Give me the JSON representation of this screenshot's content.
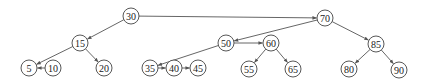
{
  "diagram": {
    "type": "skip-list-tree",
    "nodes": [
      {
        "id": "n30",
        "label": "30",
        "x": 131,
        "y": 16
      },
      {
        "id": "n70",
        "label": "70",
        "x": 325,
        "y": 18
      },
      {
        "id": "n15",
        "label": "15",
        "x": 80,
        "y": 43
      },
      {
        "id": "n50",
        "label": "50",
        "x": 226,
        "y": 43
      },
      {
        "id": "n60",
        "label": "60",
        "x": 271,
        "y": 43
      },
      {
        "id": "n85",
        "label": "85",
        "x": 376,
        "y": 44
      },
      {
        "id": "n5",
        "label": "5",
        "x": 29,
        "y": 68
      },
      {
        "id": "n10",
        "label": "10",
        "x": 53,
        "y": 68
      },
      {
        "id": "n20",
        "label": "20",
        "x": 104,
        "y": 68
      },
      {
        "id": "n35",
        "label": "35",
        "x": 150,
        "y": 68
      },
      {
        "id": "n40",
        "label": "40",
        "x": 174,
        "y": 68
      },
      {
        "id": "n45",
        "label": "45",
        "x": 198,
        "y": 68
      },
      {
        "id": "n55",
        "label": "55",
        "x": 249,
        "y": 69
      },
      {
        "id": "n65",
        "label": "65",
        "x": 293,
        "y": 69
      },
      {
        "id": "n80",
        "label": "80",
        "x": 349,
        "y": 69
      },
      {
        "id": "n90",
        "label": "90",
        "x": 399,
        "y": 70
      }
    ],
    "edges": [
      {
        "from": "n30",
        "to": "n70"
      },
      {
        "from": "n30",
        "to": "n15"
      },
      {
        "from": "n15",
        "to": "n5"
      },
      {
        "from": "n15",
        "to": "n20"
      },
      {
        "from": "n10",
        "to": "n5"
      },
      {
        "from": "n70",
        "to": "n50"
      },
      {
        "from": "n70",
        "to": "n85"
      },
      {
        "from": "n50",
        "to": "n60"
      },
      {
        "from": "n50",
        "to": "n35"
      },
      {
        "from": "n35",
        "to": "n40"
      },
      {
        "from": "n40",
        "to": "n45"
      },
      {
        "from": "n60",
        "to": "n55"
      },
      {
        "from": "n60",
        "to": "n65"
      },
      {
        "from": "n85",
        "to": "n80"
      },
      {
        "from": "n85",
        "to": "n90"
      }
    ],
    "node_radius": 8,
    "colors": {
      "edge": "#555555",
      "node_stroke": "#444444",
      "node_fill": "#ffffff",
      "text": "#222222"
    }
  }
}
